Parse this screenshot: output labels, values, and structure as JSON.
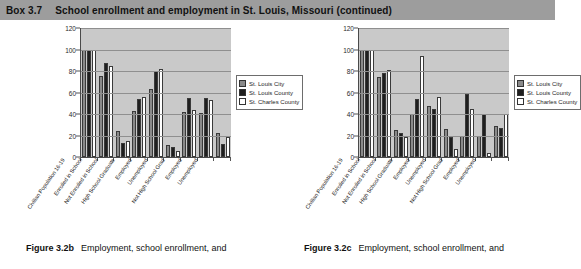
{
  "header": {
    "box_number": "Box 3.7",
    "box_title": "School enrollment and employment in St. Louis, Missouri (continued)"
  },
  "legend": {
    "items": [
      {
        "label": "St. Louis City",
        "color": "#8a8a8a"
      },
      {
        "label": "St. Louis County",
        "color": "#1f1f1f"
      },
      {
        "label": "St. Charles County",
        "color": "#ffffff"
      }
    ]
  },
  "captions": {
    "left": {
      "figure_number": "Figure 3.2b",
      "text": "Employment, school enrollment, and"
    },
    "right": {
      "figure_number": "Figure 3.2c",
      "text": "Employment, school enrollment, and"
    }
  },
  "chart_data": [
    {
      "type": "bar",
      "title": "Figure 3.2b",
      "xlabel": "",
      "ylabel": "",
      "ylim": [
        0,
        120
      ],
      "yticks": [
        0,
        20,
        40,
        60,
        80,
        100,
        120
      ],
      "grid": true,
      "legend_position": "right",
      "categories": [
        "Civilian Population 16-19",
        "Enrolled in School",
        "Not Enrolled in School",
        "High School Graduate",
        "Employed",
        "Unemployed",
        "Not High School Grad",
        "Employed",
        "Unemployed"
      ],
      "series": [
        {
          "name": "St. Louis City",
          "color": "#8a8a8a",
          "values": [
            100,
            75,
            24,
            43,
            63,
            11,
            42,
            41,
            22
          ]
        },
        {
          "name": "St. Louis County",
          "color": "#1f1f1f",
          "values": [
            100,
            87,
            13,
            54,
            80,
            9,
            55,
            55,
            12
          ]
        },
        {
          "name": "St. Charles County",
          "color": "#ffffff",
          "values": [
            100,
            85,
            15,
            56,
            82,
            6,
            44,
            53,
            19
          ]
        }
      ]
    },
    {
      "type": "bar",
      "title": "Figure 3.2c",
      "xlabel": "",
      "ylabel": "",
      "ylim": [
        0,
        120
      ],
      "yticks": [
        0,
        20,
        40,
        60,
        80,
        100,
        120
      ],
      "grid": true,
      "legend_position": "right",
      "categories": [
        "Civilian Population 16-19",
        "Enrolled in School",
        "Not Enrolled in School",
        "High School Graduate",
        "Employed",
        "Unemployed",
        "Not High School Grad",
        "Employed",
        "Unemployed"
      ],
      "series": [
        {
          "name": "St. Louis City",
          "color": "#8a8a8a",
          "values": [
            100,
            74,
            25,
            40,
            47,
            26,
            20,
            20,
            29
          ]
        },
        {
          "name": "St. Louis County",
          "color": "#1f1f1f",
          "values": [
            100,
            78,
            22,
            54,
            45,
            19,
            59,
            40,
            27
          ]
        },
        {
          "name": "St. Charles County",
          "color": "#ffffff",
          "values": [
            100,
            81,
            19,
            94,
            56,
            7,
            45,
            4,
            40
          ]
        }
      ]
    }
  ]
}
